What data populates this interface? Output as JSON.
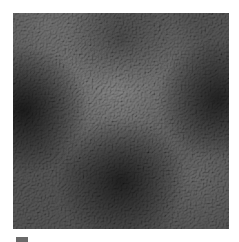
{
  "image": {
    "subject": "grayscale embossed noise texture swatch",
    "colors": {
      "background": "#ffffff",
      "base": "#3e3e3e",
      "light_region": "#5a5a5a",
      "dark_region": "#1e1e1e",
      "speckle_light": "#8a8a8a",
      "chip": "#6a6a6a"
    }
  },
  "caption": ""
}
